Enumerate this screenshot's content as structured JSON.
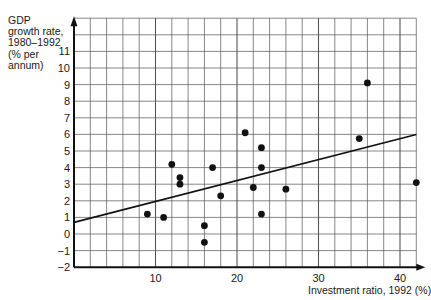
{
  "chart_data": {
    "type": "scatter",
    "title": "",
    "xlabel": "Investment ratio, 1992 (%)",
    "ylabel": "GDP growth rate, 1980–1992 (% per annum)",
    "ylabel_lines": [
      "GDP",
      "growth rate,",
      "1980–1992",
      "(% per",
      "annum)"
    ],
    "xlim": [
      0,
      42
    ],
    "ylim": [
      -2,
      13
    ],
    "x_ticks": [
      10,
      20,
      30,
      40
    ],
    "y_ticks": [
      -2,
      -1,
      0,
      1,
      2,
      3,
      4,
      5,
      6,
      7,
      8,
      9,
      10,
      11
    ],
    "grid": true,
    "grid_x_step": 2,
    "grid_y_step": 1,
    "legend": null,
    "series": [
      {
        "name": "Countries",
        "points": [
          {
            "x": 9,
            "y": 1.2
          },
          {
            "x": 11,
            "y": 1.0
          },
          {
            "x": 12,
            "y": 4.2
          },
          {
            "x": 13,
            "y": 3.4
          },
          {
            "x": 13,
            "y": 3.0
          },
          {
            "x": 16,
            "y": 0.5
          },
          {
            "x": 16,
            "y": -0.5
          },
          {
            "x": 17,
            "y": 4.0
          },
          {
            "x": 18,
            "y": 2.3
          },
          {
            "x": 21,
            "y": 6.1
          },
          {
            "x": 22,
            "y": 2.8
          },
          {
            "x": 23,
            "y": 5.2
          },
          {
            "x": 23,
            "y": 4.0
          },
          {
            "x": 23,
            "y": 1.2
          },
          {
            "x": 26,
            "y": 2.7
          },
          {
            "x": 35,
            "y": 5.75
          },
          {
            "x": 36,
            "y": 9.1
          },
          {
            "x": 42,
            "y": 3.1
          }
        ]
      }
    ],
    "trend_line": {
      "x": [
        0,
        42
      ],
      "y": [
        0.7,
        6.0
      ]
    }
  },
  "colors": {
    "grid": "#555555",
    "axis": "#111111",
    "points": "#111111",
    "trend": "#111111"
  }
}
